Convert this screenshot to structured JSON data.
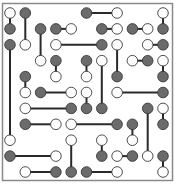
{
  "puzzle": {
    "name": "dot-link puzzle",
    "colors": {
      "background": "#ffffff",
      "border": "#8a8a8a",
      "line": "#2a2a2a",
      "filled": "#6b6b6b",
      "empty": "#ffffff",
      "outline": "#3a3a3a"
    },
    "grid": {
      "cols": 11,
      "rows": 11,
      "x0": 10,
      "dx": 15.3,
      "y0": 13,
      "dy": 15.9
    },
    "links": [
      {
        "a": [
          0,
          0,
          "W"
        ],
        "b": [
          0,
          1,
          "G"
        ]
      },
      {
        "a": [
          1,
          0,
          "G"
        ],
        "b": [
          1,
          2,
          "W"
        ]
      },
      {
        "a": [
          5,
          0,
          "G"
        ],
        "b": [
          7,
          0,
          "W"
        ]
      },
      {
        "a": [
          10,
          0,
          "W"
        ],
        "b": [
          10,
          1,
          "G"
        ]
      },
      {
        "a": [
          2,
          1,
          "G"
        ],
        "b": [
          2,
          3,
          "W"
        ]
      },
      {
        "a": [
          3,
          1,
          "G"
        ],
        "b": [
          4,
          1,
          "W"
        ]
      },
      {
        "a": [
          6,
          1,
          "G"
        ],
        "b": [
          7,
          1,
          "W"
        ]
      },
      {
        "a": [
          8,
          1,
          "G"
        ],
        "b": [
          9,
          1,
          "W"
        ]
      },
      {
        "a": [
          0,
          2,
          "G"
        ],
        "b": [
          0,
          8,
          "W"
        ]
      },
      {
        "a": [
          3,
          2,
          "W"
        ],
        "b": [
          6,
          2,
          "G"
        ]
      },
      {
        "a": [
          7,
          2,
          "W"
        ],
        "b": [
          7,
          4,
          "G"
        ]
      },
      {
        "a": [
          9,
          2,
          "W"
        ],
        "b": [
          10,
          2,
          "G"
        ]
      },
      {
        "a": [
          3,
          3,
          "G"
        ],
        "b": [
          3,
          4,
          "W"
        ]
      },
      {
        "a": [
          5,
          3,
          "G"
        ],
        "b": [
          5,
          4,
          "W"
        ]
      },
      {
        "a": [
          6,
          3,
          "W"
        ],
        "b": [
          6,
          6,
          "G"
        ]
      },
      {
        "a": [
          8,
          3,
          "W"
        ],
        "b": [
          9,
          3,
          "G"
        ]
      },
      {
        "a": [
          10,
          3,
          "W"
        ],
        "b": [
          10,
          4,
          "G"
        ]
      },
      {
        "a": [
          1,
          4,
          "G"
        ],
        "b": [
          1,
          5,
          "W"
        ]
      },
      {
        "a": [
          2,
          5,
          "G"
        ],
        "b": [
          4,
          5,
          "W"
        ]
      },
      {
        "a": [
          5,
          5,
          "W"
        ],
        "b": [
          5,
          6,
          "G"
        ]
      },
      {
        "a": [
          7,
          5,
          "W"
        ],
        "b": [
          10,
          5,
          "G"
        ]
      },
      {
        "a": [
          1,
          6,
          "W"
        ],
        "b": [
          4,
          6,
          "G"
        ]
      },
      {
        "a": [
          9,
          6,
          "G"
        ],
        "b": [
          9,
          9,
          "W"
        ]
      },
      {
        "a": [
          10,
          6,
          "W"
        ],
        "b": [
          10,
          7,
          "G"
        ]
      },
      {
        "a": [
          1,
          7,
          "G"
        ],
        "b": [
          3,
          7,
          "W"
        ]
      },
      {
        "a": [
          4,
          7,
          "W"
        ],
        "b": [
          7,
          7,
          "G"
        ]
      },
      {
        "a": [
          8,
          7,
          "G"
        ],
        "b": [
          8,
          8,
          "W"
        ]
      },
      {
        "a": [
          4,
          8,
          "W"
        ],
        "b": [
          4,
          10,
          "G"
        ]
      },
      {
        "a": [
          6,
          8,
          "W"
        ],
        "b": [
          6,
          9,
          "G"
        ]
      },
      {
        "a": [
          0,
          9,
          "G"
        ],
        "b": [
          3,
          9,
          "W"
        ]
      },
      {
        "a": [
          7,
          9,
          "W"
        ],
        "b": [
          8,
          9,
          "G"
        ]
      },
      {
        "a": [
          10,
          9,
          "G"
        ],
        "b": [
          10,
          10,
          "W"
        ]
      },
      {
        "a": [
          1,
          10,
          "W"
        ],
        "b": [
          3,
          10,
          "G"
        ]
      },
      {
        "a": [
          5,
          10,
          "G"
        ],
        "b": [
          7,
          10,
          "W"
        ]
      }
    ]
  }
}
